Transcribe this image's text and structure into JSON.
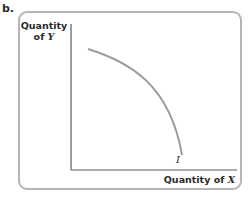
{
  "panel": {
    "label": "b."
  },
  "axes": {
    "y_label_line1": "Quantity",
    "y_label_line2_prefix": "of ",
    "y_label_var": "Y",
    "x_label_prefix": "Quantity of ",
    "x_label_var": "X"
  },
  "curve": {
    "label": "I",
    "color": "#9a9a9a"
  },
  "colors": {
    "frame": "#b5b5b5",
    "axis": "#5a5a5a",
    "text": "#2a2a2a"
  }
}
